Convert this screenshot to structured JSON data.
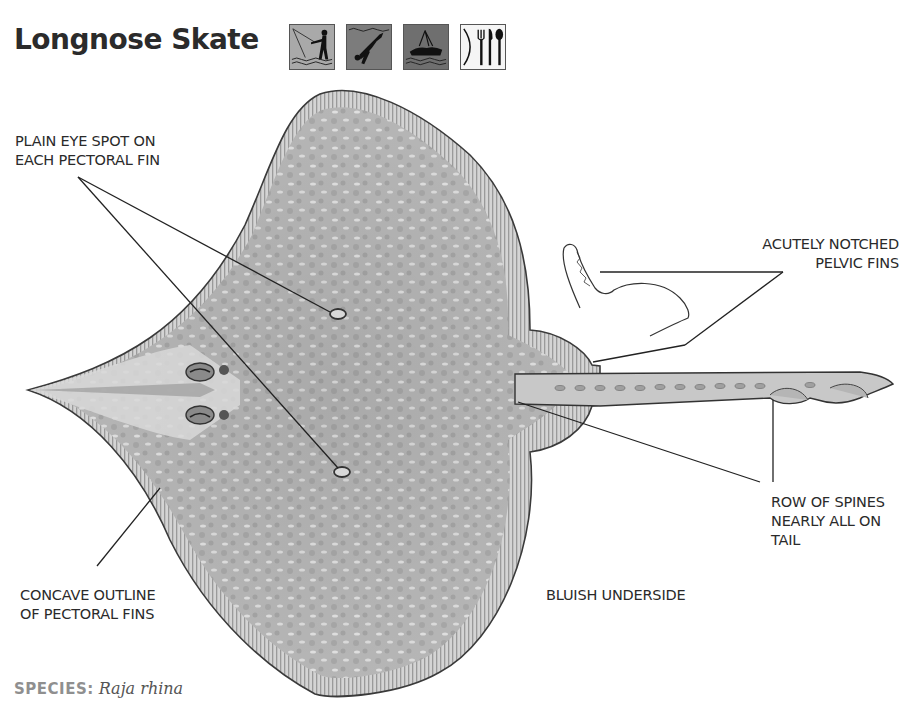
{
  "header": {
    "title": "Longnose Skate",
    "activity_icons": [
      {
        "name": "shore-fishing-icon",
        "label": "shore fishing",
        "bg": "#a8a8a8"
      },
      {
        "name": "scuba-diving-icon",
        "label": "diving",
        "bg": "#7a7a7a"
      },
      {
        "name": "boat-fishing-icon",
        "label": "boat fishing",
        "bg": "#6e6e6e"
      },
      {
        "name": "edible-icon",
        "label": "edible",
        "bg": "#f4f4f4"
      }
    ]
  },
  "illustration": {
    "subject": "Longnose skate, ventral/dorsal view",
    "body_color": "#b9b9b9",
    "outline_color": "#3a3a3a"
  },
  "labels": {
    "eye_spot": "PLAIN EYE SPOT ON\nEACH PECTORAL FIN",
    "pelvic_fins": "ACUTELY NOTCHED\nPELVIC FINS",
    "spines": "ROW OF SPINES\nNEARLY ALL ON\nTAIL",
    "concave": "CONCAVE OUTLINE\nOF PECTORAL FINS",
    "underside": "BLUISH UNDERSIDE"
  },
  "footer": {
    "species_key": "SPECIES:",
    "species_value": "Raja rhina"
  }
}
